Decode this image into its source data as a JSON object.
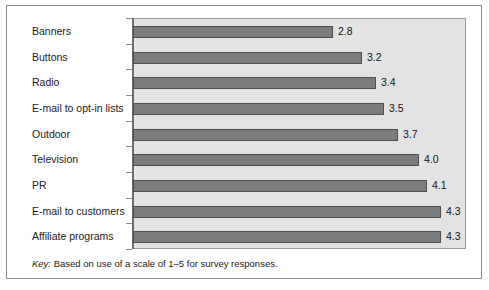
{
  "figure": {
    "key_word": "Key:",
    "key_text": "Based on use of a scale of 1–5 for survey responses."
  },
  "colors": {
    "bar_fill": "#7c7c7c",
    "bar_stroke": "#4e4e4e",
    "plot_background": "#e3e3e3",
    "plot_border": "#9a9a9a",
    "axis": "#6d6d6d",
    "frame": "#8e8e8e",
    "text": "#1b1b1b",
    "page_background": "#ffffff"
  },
  "chart_data": {
    "type": "bar",
    "orientation": "horizontal",
    "title": "",
    "subtitle": "",
    "xlabel": "",
    "ylabel": "",
    "xlim": [
      0,
      4.7
    ],
    "grid": false,
    "legend": false,
    "note": "Key: Based on use of a scale of 1–5 for survey responses.",
    "categories": [
      "Banners",
      "Buttons",
      "Radio",
      "E-mail to opt-in lists",
      "Outdoor",
      "Television",
      "PR",
      "E-mail to customers",
      "Affiliate programs"
    ],
    "values": [
      2.8,
      3.2,
      3.4,
      3.5,
      3.7,
      4.0,
      4.1,
      4.3,
      4.3
    ],
    "value_labels": [
      "2.8",
      "3.2",
      "3.4",
      "3.5",
      "3.7",
      "4.0",
      "4.1",
      "4.3",
      "4.3"
    ]
  }
}
